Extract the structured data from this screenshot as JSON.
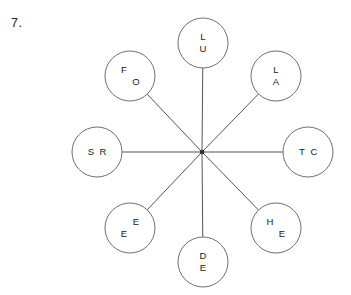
{
  "page": {
    "question_number": "7."
  },
  "diagram": {
    "type": "radial-spoke-diagram",
    "hub": {
      "x": 202,
      "y": 152,
      "label": ""
    },
    "node_radius": 25,
    "nodes": [
      {
        "id": "node-top",
        "position": "top",
        "angle_deg": 90,
        "cx": 203,
        "cy": 43,
        "letters": [
          "L",
          "U"
        ],
        "letter_layout": "stacked",
        "letter_positions": [
          {
            "char": "L",
            "dx": 0,
            "dy": -6
          },
          {
            "char": "U",
            "dx": 0,
            "dy": 6
          }
        ]
      },
      {
        "id": "node-upper-right",
        "position": "upper-right",
        "angle_deg": 45,
        "cx": 276,
        "cy": 76,
        "letters": [
          "L",
          "A"
        ],
        "letter_layout": "stacked",
        "letter_positions": [
          {
            "char": "L",
            "dx": 0,
            "dy": -6
          },
          {
            "char": "A",
            "dx": 0,
            "dy": 6
          }
        ]
      },
      {
        "id": "node-right",
        "position": "right",
        "angle_deg": 0,
        "cx": 308,
        "cy": 152,
        "letters": [
          "T",
          "C"
        ],
        "letter_layout": "side-by-side",
        "letter_positions": [
          {
            "char": "T",
            "dx": -6,
            "dy": 0
          },
          {
            "char": "C",
            "dx": 6,
            "dy": 0
          }
        ]
      },
      {
        "id": "node-lower-right",
        "position": "lower-right",
        "angle_deg": -45,
        "cx": 276,
        "cy": 228,
        "letters": [
          "H",
          "E"
        ],
        "letter_layout": "diagonal-down-right",
        "letter_positions": [
          {
            "char": "H",
            "dx": -6,
            "dy": -6
          },
          {
            "char": "E",
            "dx": 6,
            "dy": 6
          }
        ]
      },
      {
        "id": "node-bottom",
        "position": "bottom",
        "angle_deg": -90,
        "cx": 203,
        "cy": 262,
        "letters": [
          "D",
          "E"
        ],
        "letter_layout": "stacked",
        "letter_positions": [
          {
            "char": "D",
            "dx": 0,
            "dy": -6
          },
          {
            "char": "E",
            "dx": 0,
            "dy": 6
          }
        ]
      },
      {
        "id": "node-lower-left",
        "position": "lower-left",
        "angle_deg": -135,
        "cx": 130,
        "cy": 228,
        "letters": [
          "E",
          "E"
        ],
        "letter_layout": "diagonal-down-left",
        "letter_positions": [
          {
            "char": "E",
            "dx": 6,
            "dy": -6
          },
          {
            "char": "E",
            "dx": -6,
            "dy": 6
          }
        ]
      },
      {
        "id": "node-left",
        "position": "left",
        "angle_deg": 180,
        "cx": 97,
        "cy": 152,
        "letters": [
          "S",
          "R"
        ],
        "letter_layout": "side-by-side",
        "letter_positions": [
          {
            "char": "S",
            "dx": -6,
            "dy": 0
          },
          {
            "char": "R",
            "dx": 6,
            "dy": 0
          }
        ]
      },
      {
        "id": "node-upper-left",
        "position": "upper-left",
        "angle_deg": 135,
        "cx": 130,
        "cy": 76,
        "letters": [
          "F",
          "O"
        ],
        "letter_layout": "diagonal-down-right",
        "letter_positions": [
          {
            "char": "F",
            "dx": -6,
            "dy": -6
          },
          {
            "char": "O",
            "dx": 6,
            "dy": 6
          }
        ]
      }
    ],
    "colors": {
      "circle_stroke": "#6f6f6f",
      "line_stroke": "#555555",
      "text": "#1a1a1a",
      "background": "#ffffff"
    }
  }
}
